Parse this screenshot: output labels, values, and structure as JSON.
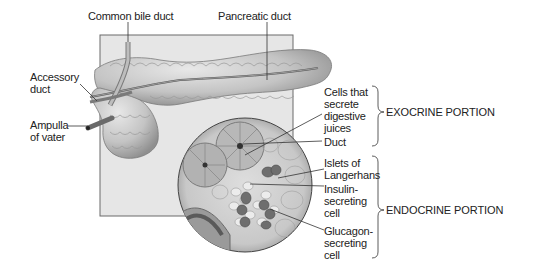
{
  "diagram": {
    "labels": {
      "common_bile_duct": "Common bile duct",
      "pancreatic_duct": "Pancreatic duct",
      "accessory_duct": "Accessory\nduct",
      "ampulla_of_vater": "Ampulla\nof vater",
      "cells_secrete": "Cells that\nsecrete\ndigestive\njuices",
      "duct": "Duct",
      "islets": "Islets of\nLangerhans",
      "insulin_cell": "Insulin-\nsecreting\ncell",
      "glucagon_cell": "Glucagon-\nsecreting\ncell"
    },
    "portions": {
      "exocrine": "EXOCRINE PORTION",
      "endocrine": "ENDOCRINE PORTION"
    },
    "colors": {
      "background_panel": "#e6e6e6",
      "tissue": "#c9c9c9",
      "tissue_dark": "#8a8a8a",
      "islet_cells": "#6e6e6e",
      "outline": "#555555"
    }
  }
}
